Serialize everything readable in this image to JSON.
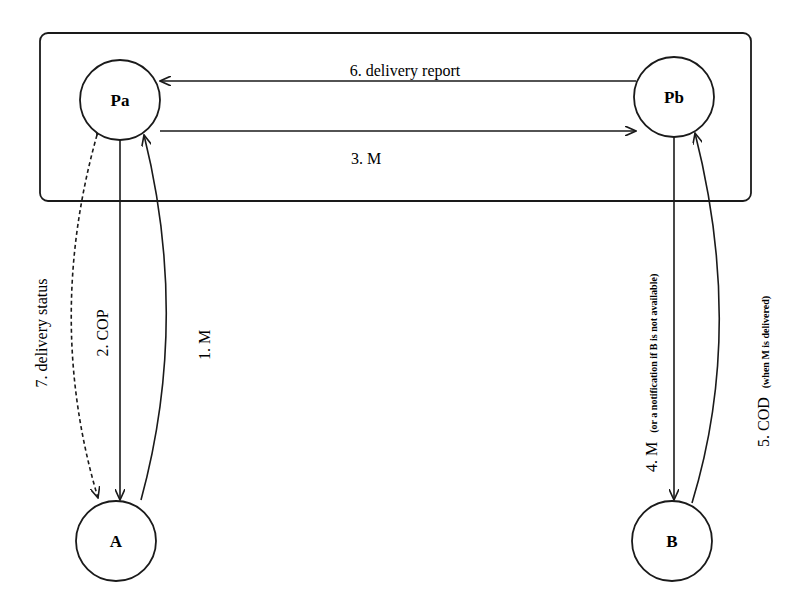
{
  "diagram": {
    "type": "message-flow",
    "frame": {
      "label": ""
    },
    "nodes": {
      "pa": {
        "label": "Pa"
      },
      "pb": {
        "label": "Pb"
      },
      "a": {
        "label": "A"
      },
      "b": {
        "label": "B"
      }
    },
    "edges": {
      "e1": {
        "from": "A",
        "to": "Pa",
        "label": "1. M",
        "style": "solid-curved"
      },
      "e2": {
        "from": "Pa",
        "to": "A",
        "label": "2. COP",
        "style": "solid"
      },
      "e3": {
        "from": "Pa",
        "to": "Pb",
        "label": "3. M",
        "style": "solid"
      },
      "e4": {
        "from": "Pb",
        "to": "B",
        "label": "4. M",
        "note": "(or a notification if B is not available)",
        "style": "solid"
      },
      "e5": {
        "from": "B",
        "to": "Pb",
        "label": "5. COD",
        "note": "(when M is delivered)",
        "style": "solid-curved"
      },
      "e6": {
        "from": "Pb",
        "to": "Pa",
        "label": "6. delivery report",
        "style": "solid"
      },
      "e7": {
        "from": "Pa",
        "to": "A",
        "label": "7. delivery status",
        "style": "dashed-curved-bidirectional"
      }
    },
    "colors": {
      "stroke": "#1a1a1a",
      "background": "#ffffff"
    }
  }
}
